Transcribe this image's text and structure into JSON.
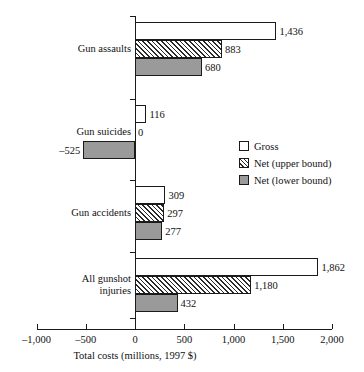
{
  "chart_data": {
    "type": "bar",
    "orientation": "horizontal",
    "title": "",
    "xlabel": "Total costs (millions, 1997 $)",
    "ylabel": "",
    "xlim": [
      -1000,
      2000
    ],
    "xticks": [
      -1000,
      -500,
      0,
      500,
      1000,
      1500,
      2000
    ],
    "xticklabels": [
      "–1,000",
      "–500",
      "0",
      "500",
      "1,000",
      "1,500",
      "2,000"
    ],
    "grid": false,
    "legend_position": "middle-right",
    "categories": [
      "Gun assaults",
      "Gun suicides",
      "Gun accidents",
      "All gunshot injuries"
    ],
    "category_labels_multiline": [
      [
        "Gun assaults"
      ],
      [
        "Gun suicides"
      ],
      [
        "Gun accidents"
      ],
      [
        "All gunshot",
        "injuries"
      ]
    ],
    "series": [
      {
        "name": "Gross",
        "style": "white",
        "values": [
          1436,
          116,
          309,
          1862
        ],
        "data_labels": [
          "1,436",
          "116",
          "309",
          "1,862"
        ]
      },
      {
        "name": "Net (upper bound)",
        "style": "hatched",
        "values": [
          883,
          0,
          297,
          1180
        ],
        "data_labels": [
          "883",
          "0",
          "297",
          "1,180"
        ]
      },
      {
        "name": "Net (lower bound)",
        "style": "gray",
        "values": [
          680,
          -525,
          277,
          432
        ],
        "data_labels": [
          "680",
          "–525",
          "277",
          "432"
        ]
      }
    ],
    "colors": {
      "gross": "#ffffff",
      "net_upper": "#ffffff",
      "net_lower": "#9a9a9a",
      "outline": "#1a1a1a"
    }
  },
  "legend": {
    "items": [
      {
        "label": "Gross",
        "style": "gross"
      },
      {
        "label": "Net (upper bound)",
        "style": "netupper"
      },
      {
        "label": "Net (lower bound)",
        "style": "netlower"
      }
    ]
  }
}
